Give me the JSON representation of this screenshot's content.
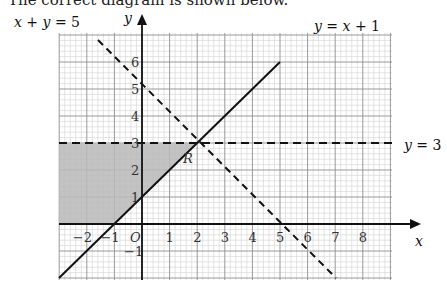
{
  "heading": "The correct diagram is shown below.",
  "axes": {
    "x_label": "x",
    "y_label": "y",
    "origin_label": "O",
    "x_ticks": [
      "−2",
      "−1",
      "1",
      "2",
      "3",
      "4",
      "5",
      "6",
      "7",
      "8"
    ],
    "y_ticks": [
      "−1",
      "1",
      "2",
      "3",
      "4",
      "5",
      "6"
    ]
  },
  "lines": {
    "line1": {
      "equation": "y = x + 1",
      "style": "solid"
    },
    "line2": {
      "equation": "x + y = 5",
      "style": "dashed"
    },
    "line3": {
      "equation": "y = 3",
      "style": "dashed"
    }
  },
  "region": {
    "label": "R",
    "fill": "#bdbdbd"
  },
  "colors": {
    "minor_grid": "#cfcfcf",
    "major_grid": "#8a8a8a",
    "axis": "#111111"
  },
  "chart_data": {
    "type": "line",
    "title": "",
    "xlabel": "x",
    "ylabel": "y",
    "xlim": [
      -3,
      9
    ],
    "ylim": [
      -2,
      7
    ],
    "grid": true,
    "series": [
      {
        "name": "y = x + 1",
        "style": "solid",
        "points": [
          [
            -3,
            -2
          ],
          [
            5,
            6
          ]
        ]
      },
      {
        "name": "x + y = 5",
        "style": "dashed",
        "points": [
          [
            -2,
            7
          ],
          [
            7,
            -2
          ]
        ]
      },
      {
        "name": "y = 3",
        "style": "dashed",
        "points": [
          [
            -3,
            3
          ],
          [
            9,
            3
          ]
        ]
      }
    ],
    "shaded_region": {
      "label": "R",
      "vertices": [
        [
          -3,
          0
        ],
        [
          -1,
          0
        ],
        [
          2,
          3
        ],
        [
          -3,
          3
        ]
      ]
    }
  }
}
